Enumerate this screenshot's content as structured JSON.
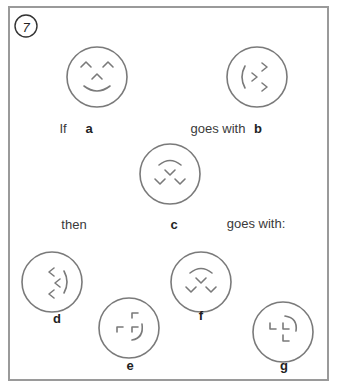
{
  "puzzle": {
    "number": "7",
    "accent_stroke": "#7a7a7a",
    "border_color": "#9a9a9a",
    "sentence": {
      "if": "If",
      "goes_with_1": "goes with",
      "then": "then",
      "goes_with_2": "goes with:"
    },
    "figures": [
      {
        "id": "a",
        "label": "a",
        "description": "smiling face with two caret eyes, caret nose and curved smile"
      },
      {
        "id": "b",
        "label": "b",
        "description": "face rotated 90 degrees: smile on left, carets pointing right"
      },
      {
        "id": "c",
        "label": "c",
        "description": "face with arc on top and three v-shaped marks below"
      },
      {
        "id": "d",
        "label": "d",
        "description": "option d: arc on right, three left-pointing carets"
      },
      {
        "id": "e",
        "label": "e",
        "description": "option e: corner brackets with arc on right"
      },
      {
        "id": "f",
        "label": "f",
        "description": "option f: identical to c"
      },
      {
        "id": "g",
        "label": "g",
        "description": "option g: L-shaped corners with arc on upper right"
      }
    ]
  }
}
